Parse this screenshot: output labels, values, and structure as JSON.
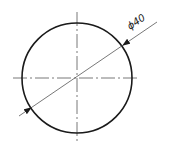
{
  "diagram": {
    "type": "technical-drawing",
    "dimension_label": "ϕ40",
    "colors": {
      "background": "#ffffff",
      "outline": "#1a1a1a",
      "thin_line": "#555555"
    },
    "circle": {
      "cx": 77,
      "cy": 78,
      "r": 55
    },
    "centerlines": {
      "horizontal": {
        "x1": 13,
        "x2": 140,
        "y": 78
      },
      "vertical": {
        "x": 77,
        "y1": 12,
        "y2": 143
      }
    },
    "dimension_line": {
      "x1": 19,
      "y1": 116,
      "x2": 157,
      "y2": 22
    }
  }
}
